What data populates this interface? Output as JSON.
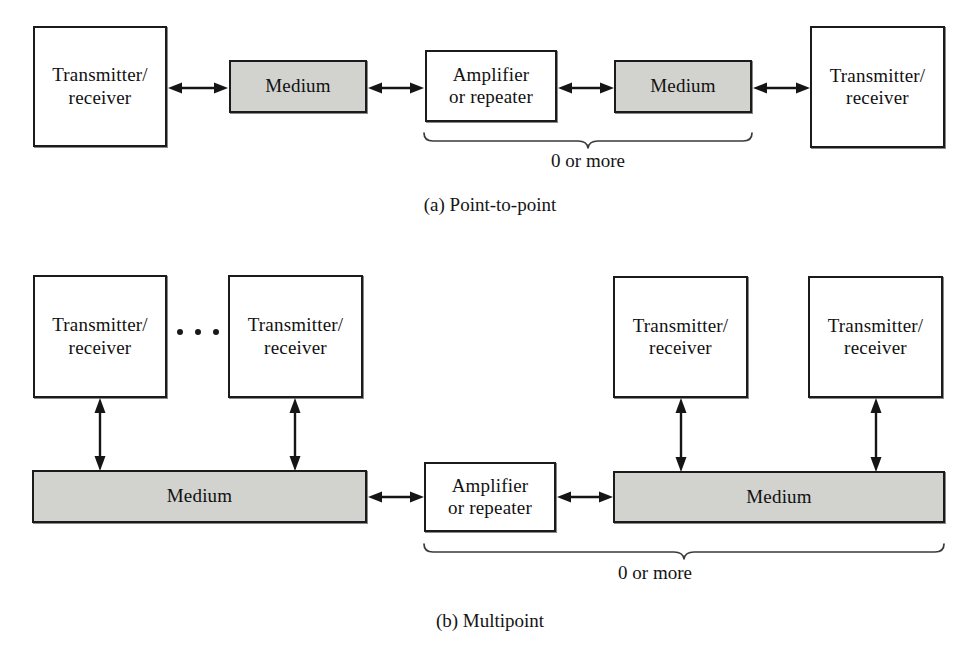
{
  "figure": {
    "title_a": "(a) Point-to-point",
    "title_b": "(b) Multipoint",
    "labels": {
      "transceiver_line1": "Transmitter/",
      "transceiver_line2": "receiver",
      "medium": "Medium",
      "amplifier_line1": "Amplifier",
      "amplifier_line2": "or repeater",
      "zero_or_more": "0 or more",
      "ellipsis": "..."
    },
    "colors": {
      "medium_fill": "#d2d2cf",
      "stroke": "#1b1b1b",
      "text": "#111111",
      "page_background": "#ffffff"
    }
  },
  "diagram_a": {
    "name": "point-to-point",
    "nodes": [
      {
        "id": "a-tx-left",
        "type": "transceiver",
        "line1": "Transmitter/",
        "line2": "receiver"
      },
      {
        "id": "a-medium-1",
        "type": "medium",
        "label": "Medium"
      },
      {
        "id": "a-amplifier",
        "type": "amplifier",
        "line1": "Amplifier",
        "line2": "or repeater"
      },
      {
        "id": "a-medium-2",
        "type": "medium",
        "label": "Medium"
      },
      {
        "id": "a-tx-right",
        "type": "transceiver",
        "line1": "Transmitter/",
        "line2": "receiver"
      }
    ],
    "links": [
      {
        "from": "a-tx-left",
        "to": "a-medium-1",
        "kind": "bidirectional"
      },
      {
        "from": "a-medium-1",
        "to": "a-amplifier",
        "kind": "bidirectional"
      },
      {
        "from": "a-amplifier",
        "to": "a-medium-2",
        "kind": "bidirectional"
      },
      {
        "from": "a-medium-2",
        "to": "a-tx-right",
        "kind": "bidirectional"
      }
    ],
    "annotation": {
      "text": "0 or more",
      "spans": [
        "a-amplifier",
        "a-medium-2"
      ]
    },
    "caption": "(a) Point-to-point"
  },
  "diagram_b": {
    "name": "multipoint",
    "nodes": [
      {
        "id": "b-tx-1",
        "type": "transceiver",
        "line1": "Transmitter/",
        "line2": "receiver"
      },
      {
        "id": "b-tx-2",
        "type": "transceiver",
        "line1": "Transmitter/",
        "line2": "receiver"
      },
      {
        "id": "b-medium-1",
        "type": "medium-bar",
        "label": "Medium"
      },
      {
        "id": "b-amplifier",
        "type": "amplifier",
        "line1": "Amplifier",
        "line2": "or repeater"
      },
      {
        "id": "b-medium-2",
        "type": "medium-bar",
        "label": "Medium"
      },
      {
        "id": "b-tx-3",
        "type": "transceiver",
        "line1": "Transmitter/",
        "line2": "receiver"
      },
      {
        "id": "b-tx-4",
        "type": "transceiver",
        "line1": "Transmitter/",
        "line2": "receiver"
      }
    ],
    "ellipsis_between": [
      "b-tx-1",
      "b-tx-2"
    ],
    "links": [
      {
        "from": "b-tx-1",
        "to": "b-medium-1",
        "kind": "bidirectional",
        "orientation": "vertical"
      },
      {
        "from": "b-tx-2",
        "to": "b-medium-1",
        "kind": "bidirectional",
        "orientation": "vertical"
      },
      {
        "from": "b-medium-1",
        "to": "b-amplifier",
        "kind": "bidirectional",
        "orientation": "horizontal"
      },
      {
        "from": "b-amplifier",
        "to": "b-medium-2",
        "kind": "bidirectional",
        "orientation": "horizontal"
      },
      {
        "from": "b-tx-3",
        "to": "b-medium-2",
        "kind": "bidirectional",
        "orientation": "vertical"
      },
      {
        "from": "b-tx-4",
        "to": "b-medium-2",
        "kind": "bidirectional",
        "orientation": "vertical"
      }
    ],
    "annotation": {
      "text": "0 or more",
      "spans": [
        "b-amplifier",
        "b-medium-2"
      ]
    },
    "caption": "(b) Multipoint"
  }
}
